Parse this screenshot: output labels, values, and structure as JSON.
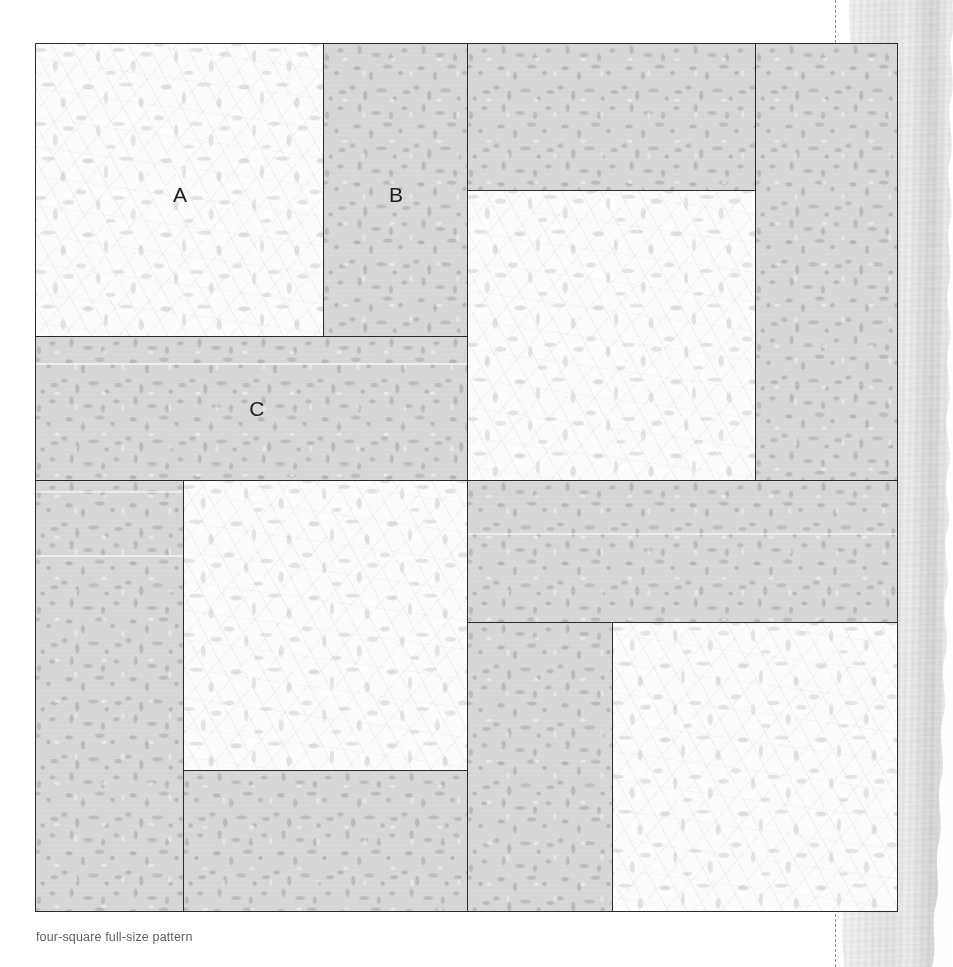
{
  "caption": "four-square full-size pattern",
  "colors": {
    "light_fabric": "#fcfcfc",
    "grey_fabric": "#d6d6d6",
    "seam_line": "#2b2b2b",
    "label_text": "#1c1c1c",
    "caption_text": "#5e5e5e",
    "fold_line": "#8e8e8e",
    "paper_edge": "#ededed"
  },
  "pattern": {
    "name": "four-square full-size pattern",
    "block_label": "four-square",
    "unit_count": 4,
    "fabrics": [
      {
        "key": "light",
        "name": "light tone-on-tone floral"
      },
      {
        "key": "grey",
        "name": "grey mottled print"
      }
    ],
    "labels": [
      {
        "id": "A",
        "text": "A",
        "fabric": "light"
      },
      {
        "id": "B",
        "text": "B",
        "fabric": "grey"
      },
      {
        "id": "C",
        "text": "C",
        "fabric": "grey"
      }
    ],
    "quadrants": [
      {
        "id": "top-left",
        "pieces": [
          "A",
          "B",
          "C"
        ]
      },
      {
        "id": "top-right",
        "pieces": [
          "A",
          "B",
          "C"
        ]
      },
      {
        "id": "bottom-left",
        "pieces": [
          "A",
          "B",
          "C"
        ]
      },
      {
        "id": "bottom-right",
        "pieces": [
          "A",
          "B",
          "C"
        ]
      }
    ]
  },
  "fold_line": {
    "label": "trim/fold line",
    "style": "dashed"
  }
}
